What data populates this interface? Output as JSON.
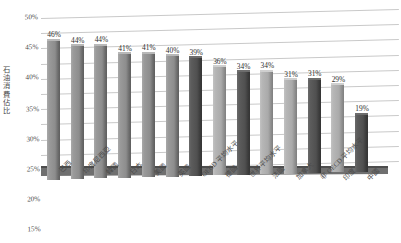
{
  "chart_data": {
    "type": "bar",
    "title": "",
    "xlabel": "",
    "ylabel": "石油消費佔比",
    "ylim": [
      0,
      50
    ],
    "ytick_labels": [
      "50%",
      "45%",
      "40%",
      "35%",
      "30%",
      "25%",
      "20%",
      "15%",
      "10%",
      "5%",
      "0"
    ],
    "ytick_values": [
      50,
      45,
      40,
      35,
      30,
      25,
      20,
      15,
      10,
      5,
      0
    ],
    "grid": true,
    "legend": "none",
    "value_suffix": "%",
    "categories": [
      "巴西",
      "印度尼西亞",
      "韓國",
      "日本",
      "美國",
      "英國",
      "OECD 平均水平",
      "德國",
      "世界平均水平",
      "法國",
      "加拿大",
      "非 OECD 平均水平",
      "印度",
      "中國"
    ],
    "values": [
      46,
      44,
      44,
      41,
      41,
      40,
      39,
      36,
      34,
      34,
      31,
      31,
      29,
      19
    ],
    "value_labels": [
      "46%",
      "44%",
      "44%",
      "41%",
      "41%",
      "40%",
      "39%",
      "36%",
      "34%",
      "34%",
      "31%",
      "31%",
      "29%",
      "19%"
    ],
    "bar_styles": [
      "mid",
      "mid",
      "mid",
      "mid",
      "mid",
      "mid",
      "dark",
      "light",
      "dark",
      "light",
      "light",
      "dark",
      "light",
      "dark"
    ],
    "colors": {
      "bar_mid": "#8d8d8d",
      "bar_dark": "#505050",
      "bar_light": "#aaaaaa",
      "gridline": "#c9c9c9",
      "floor": "#6f6f6f",
      "text": "#3a3a3a",
      "background": "#ffffff"
    }
  }
}
